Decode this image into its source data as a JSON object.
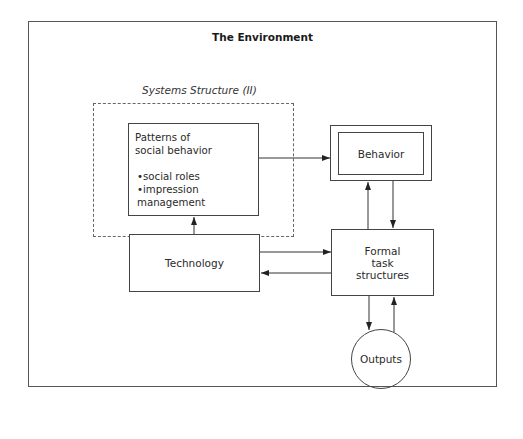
{
  "diagram": {
    "title": "The Environment",
    "systems_label": "Systems Structure (II)",
    "nodes": {
      "patterns": {
        "heading_line1": "Patterns of",
        "heading_line2": "social behavior",
        "bullets": [
          "•social roles",
          "•impression management"
        ]
      },
      "behavior": {
        "label": "Behavior"
      },
      "technology": {
        "label": "Technology"
      },
      "formal": {
        "line1": "Formal",
        "line2": "task",
        "line3": "structures"
      },
      "outputs": {
        "label": "Outputs"
      }
    },
    "edges": [
      {
        "from": "Patterns of social behavior",
        "to": "Behavior"
      },
      {
        "from": "Technology",
        "to": "Patterns of social behavior"
      },
      {
        "from": "Technology",
        "to": "Formal task structures"
      },
      {
        "from": "Formal task structures",
        "to": "Technology"
      },
      {
        "from": "Formal task structures",
        "to": "Behavior"
      },
      {
        "from": "Behavior",
        "to": "Formal task structures"
      },
      {
        "from": "Formal task structures",
        "to": "Outputs"
      },
      {
        "from": "Outputs",
        "to": "Formal task structures"
      }
    ]
  }
}
